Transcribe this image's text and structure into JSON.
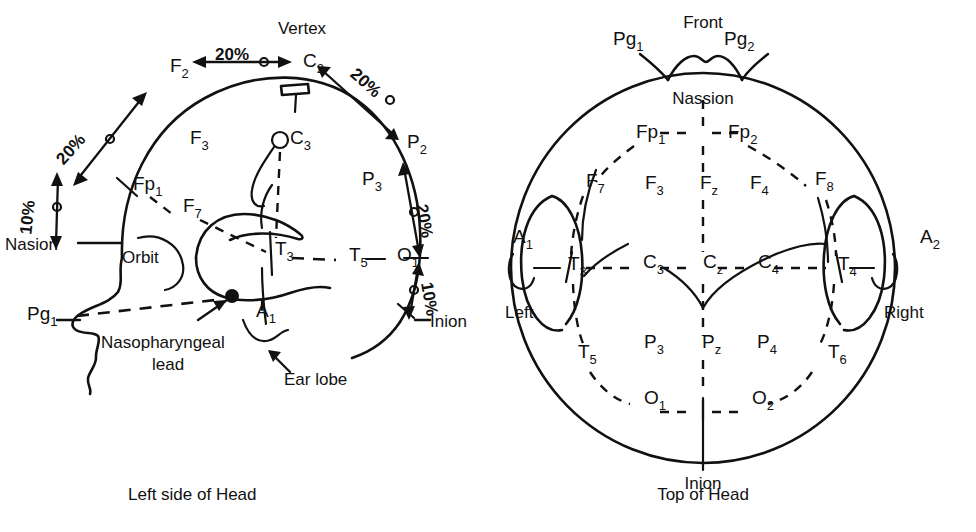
{
  "figure": {
    "title_left": "Left side of Head",
    "title_right": "Top of Head",
    "caption": ""
  },
  "left_view": {
    "name": "Left side of Head",
    "anatomy_labels": {
      "vertex": "Vertex",
      "nasion": "Nasion",
      "orbit": "Orbit",
      "inion": "Inion",
      "ear_lobe": "Ear lobe",
      "nasopharyngeal_lead_line1": "Nasopharyngeal",
      "nasopharyngeal_lead_line2": "lead"
    },
    "electrodes": [
      {
        "base": "F",
        "sub": "2",
        "x": 170,
        "y": 72
      },
      {
        "base": "C",
        "sub": "2",
        "x": 303,
        "y": 67
      },
      {
        "base": "P",
        "sub": "2",
        "x": 407,
        "y": 148
      },
      {
        "base": "F",
        "sub": "3",
        "x": 190,
        "y": 144
      },
      {
        "base": "C",
        "sub": "3",
        "x": 290,
        "y": 144
      },
      {
        "base": "P",
        "sub": "3",
        "x": 362,
        "y": 185
      },
      {
        "base": "Fp",
        "sub": "1",
        "x": 133,
        "y": 190
      },
      {
        "base": "F",
        "sub": "7",
        "x": 183,
        "y": 212
      },
      {
        "base": "T",
        "sub": "3",
        "x": 275,
        "y": 255
      },
      {
        "base": "T",
        "sub": "5",
        "x": 349,
        "y": 261
      },
      {
        "base": "O",
        "sub": "1",
        "x": 397,
        "y": 261
      },
      {
        "base": "A",
        "sub": "1",
        "x": 256,
        "y": 317
      },
      {
        "base": "Pg",
        "sub": "1",
        "x": 27,
        "y": 320
      }
    ],
    "percent_labels": [
      {
        "text": "20%",
        "x": 232,
        "y": 60,
        "rotate": 0
      },
      {
        "text": "20%",
        "x": 362,
        "y": 87,
        "rotate": 42
      },
      {
        "text": "20%",
        "x": 75,
        "y": 153,
        "rotate": -48
      },
      {
        "text": "20%",
        "x": 419,
        "y": 222,
        "rotate": 80
      },
      {
        "text": "10%",
        "x": 33,
        "y": 218,
        "rotate": -84
      },
      {
        "text": "10%",
        "x": 424,
        "y": 300,
        "rotate": 80
      }
    ]
  },
  "top_view": {
    "name": "Top of Head",
    "anatomy_labels": {
      "front": "Front",
      "nassion": "Nassion",
      "inion": "Inion",
      "left": "Left",
      "right": "Right"
    },
    "electrodes": [
      {
        "base": "Pg",
        "sub": "1",
        "x": 613,
        "y": 45
      },
      {
        "base": "Pg",
        "sub": "2",
        "x": 724,
        "y": 45
      },
      {
        "base": "Fp",
        "sub": "1",
        "x": 636,
        "y": 138
      },
      {
        "base": "Fp",
        "sub": "2",
        "x": 728,
        "y": 138
      },
      {
        "base": "F",
        "sub": "7",
        "x": 586,
        "y": 187
      },
      {
        "base": "F",
        "sub": "3",
        "x": 645,
        "y": 189
      },
      {
        "base": "F",
        "sub": "z",
        "x": 700,
        "y": 189
      },
      {
        "base": "F",
        "sub": "4",
        "x": 750,
        "y": 189
      },
      {
        "base": "F",
        "sub": "8",
        "x": 815,
        "y": 185
      },
      {
        "base": "A",
        "sub": "1",
        "x": 513,
        "y": 243
      },
      {
        "base": "T",
        "sub": "3",
        "x": 568,
        "y": 270
      },
      {
        "base": "C",
        "sub": "3",
        "x": 643,
        "y": 268
      },
      {
        "base": "C",
        "sub": "z",
        "x": 703,
        "y": 268
      },
      {
        "base": "C",
        "sub": "4",
        "x": 758,
        "y": 268
      },
      {
        "base": "T",
        "sub": "4",
        "x": 838,
        "y": 270
      },
      {
        "base": "A",
        "sub": "2",
        "x": 920,
        "y": 243
      },
      {
        "base": "T",
        "sub": "5",
        "x": 578,
        "y": 358
      },
      {
        "base": "P",
        "sub": "3",
        "x": 644,
        "y": 348
      },
      {
        "base": "P",
        "sub": "z",
        "x": 702,
        "y": 348
      },
      {
        "base": "P",
        "sub": "4",
        "x": 757,
        "y": 348
      },
      {
        "base": "T",
        "sub": "6",
        "x": 828,
        "y": 358
      },
      {
        "base": "O",
        "sub": "1",
        "x": 644,
        "y": 404
      },
      {
        "base": "O",
        "sub": "2",
        "x": 752,
        "y": 404
      }
    ]
  }
}
